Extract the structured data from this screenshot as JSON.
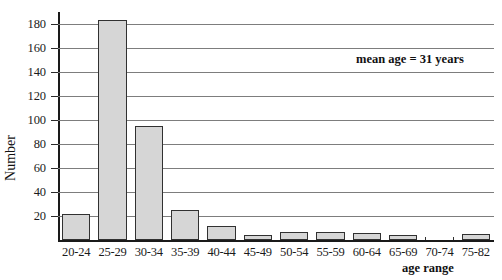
{
  "chart_data": {
    "type": "bar",
    "title": "",
    "subtitle": "",
    "xlabel": "age range",
    "ylabel": "Number",
    "categories": [
      "20-24",
      "25-29",
      "30-34",
      "35-39",
      "40-44",
      "45-49",
      "50-54",
      "55-59",
      "60-64",
      "65-69",
      "70-74",
      "75-82"
    ],
    "values": [
      22,
      183,
      95,
      25,
      12,
      4,
      7,
      7,
      6,
      4,
      0,
      5
    ],
    "series": [
      {
        "name": "Number",
        "values": [
          22,
          183,
          95,
          25,
          12,
          4,
          7,
          7,
          6,
          4,
          0,
          5
        ]
      }
    ],
    "ylim": [
      0,
      190
    ],
    "yticks": [
      20,
      40,
      60,
      80,
      100,
      120,
      140,
      160,
      180
    ],
    "ytick_labels": [
      "20",
      "40",
      "60",
      "80",
      "100",
      "120",
      "140",
      "160",
      "180"
    ],
    "grid": true,
    "grid_axis": "y",
    "legend": null,
    "legend_position": "none",
    "annotations": [
      {
        "text": "mean age = 31 years",
        "x": "60-64",
        "y": 155,
        "bold": true
      }
    ],
    "colors": {
      "bar_fill": "#d6d6d6",
      "bar_edge": "#313131",
      "gridline": "#7d7d7d",
      "axis": "#1a1a1a",
      "text": "#1b1b1b",
      "background": "#ffffff"
    }
  }
}
